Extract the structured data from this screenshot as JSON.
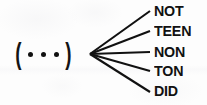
{
  "figure": {
    "type": "fan-out-derivation-diagram",
    "background_color": "#fdfdfd",
    "ink_color": "#111111"
  },
  "source": {
    "name": "feature-bundle",
    "open_bracket": "(",
    "close_bracket": ")",
    "dot_count": 3,
    "dot_glyph": "•"
  },
  "branches": {
    "count": 5,
    "origin_x": 90,
    "origin_y": 54,
    "items": [
      {
        "label": "NOT",
        "end_x": 150,
        "end_y": 11,
        "top": 3
      },
      {
        "label": "TEEN",
        "end_x": 150,
        "end_y": 31,
        "top": 23
      },
      {
        "label": "NON",
        "end_x": 150,
        "end_y": 52,
        "top": 44
      },
      {
        "label": "TON",
        "end_x": 150,
        "end_y": 71,
        "top": 63
      },
      {
        "label": "DID",
        "end_x": 150,
        "end_y": 92,
        "top": 83
      }
    ]
  }
}
